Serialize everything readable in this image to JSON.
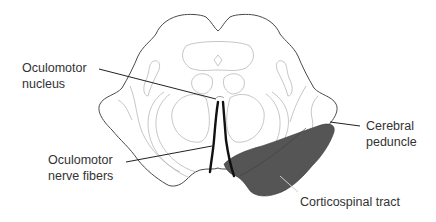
{
  "diagram": {
    "colors": {
      "background": "#ffffff",
      "outline": "#4a4a4a",
      "inner_structures": "#b8b8b8",
      "corticospinal_tract_fill": "#555555",
      "nerve_fibers": "#111111",
      "label_text": "#333333"
    },
    "labels": {
      "oculomotor_nucleus": "Oculomotor\nnucleus",
      "oculomotor_nerve_fibers": "Oculomotor\nnerve fibers",
      "cerebral_peduncle": "Cerebral\npeduncle",
      "corticospinal_tract": "Corticospinal tract"
    }
  }
}
